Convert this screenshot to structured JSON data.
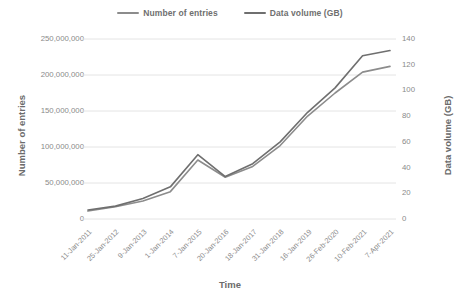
{
  "chart_data": {
    "type": "line",
    "title": "",
    "xlabel": "Time",
    "ylabel": "Number of entries",
    "y2label": "Data volume (GB)",
    "grid": true,
    "legend_position": "top",
    "categories": [
      "11-Jan-2011",
      "25-Jan-2012",
      "9-Jan-2013",
      "1-Jan-2014",
      "7-Jan-2015",
      "20-Jan-2016",
      "18-Jan-2017",
      "31-Jan-2018",
      "16-Jan-2019",
      "26-Feb-2020",
      "10-Feb-2021",
      "7-Apr-2021"
    ],
    "series": [
      {
        "name": "Number of entries",
        "axis": "left",
        "color": "#8c8c8c",
        "values": [
          11000000,
          17000000,
          25000000,
          38000000,
          82000000,
          58000000,
          73000000,
          102000000,
          143000000,
          175000000,
          204000000,
          212000000
        ]
      },
      {
        "name": "Data volume (GB)",
        "axis": "right",
        "color": "#6f6f6f",
        "values": [
          7,
          10,
          16,
          25,
          50,
          33,
          43,
          60,
          83,
          102,
          127,
          131
        ]
      }
    ],
    "ylim": [
      0,
      250000000
    ],
    "yticks": [
      0,
      50000000,
      100000000,
      150000000,
      200000000,
      250000000
    ],
    "ytick_labels": [
      "0",
      "50,000,000",
      "100,000,000",
      "150,000,000",
      "200,000,000",
      "250,000,000"
    ],
    "y2lim": [
      0,
      140
    ],
    "y2ticks": [
      0,
      20,
      40,
      60,
      80,
      100,
      120,
      140
    ],
    "y2tick_labels": [
      "0",
      "20",
      "40",
      "60",
      "80",
      "100",
      "120",
      "140"
    ]
  },
  "legend": {
    "items": [
      {
        "label": "Number of entries",
        "color": "#8c8c8c"
      },
      {
        "label": "Data volume (GB)",
        "color": "#6f6f6f"
      }
    ]
  },
  "axes": {
    "x_title": "Time",
    "y_left_title": "Number of entries",
    "y_right_title": "Data volume (GB)"
  },
  "colors": {
    "background": "#ffffff",
    "gridline": "#e4e4e4",
    "text": "#8a8a8a",
    "series_entries": "#8c8c8c",
    "series_volume": "#6f6f6f"
  }
}
